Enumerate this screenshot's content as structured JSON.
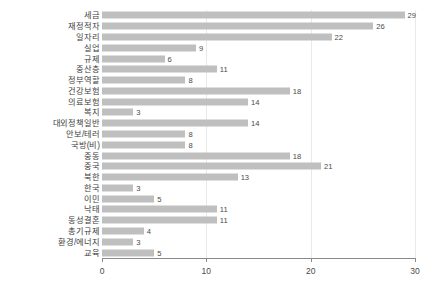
{
  "chart_data": {
    "type": "bar",
    "orientation": "horizontal",
    "title": "",
    "subtitle": "",
    "xlabel": "",
    "ylabel": "",
    "xlim": [
      0,
      30
    ],
    "xticks": [
      "0",
      "10",
      "20",
      "30"
    ],
    "xtick_values": [
      0,
      10,
      20,
      30
    ],
    "grid": true,
    "legend": null,
    "bar_color": "#bfbfbf",
    "axis_color": "#8a8a8a",
    "categories": [
      "세금",
      "재정적자",
      "일자리",
      "실업",
      "규제",
      "중산층",
      "정부역할",
      "건강보험",
      "의료보험",
      "복지",
      "대외정책일반",
      "안보/테러",
      "국방(비)",
      "중동",
      "중국",
      "북한",
      "한국",
      "이민",
      "낙태",
      "동성결혼",
      "총기규제",
      "환경/에너지",
      "교육"
    ],
    "values": [
      29,
      26,
      22,
      9,
      6,
      11,
      8,
      18,
      14,
      3,
      14,
      8,
      8,
      18,
      21,
      13,
      3,
      5,
      11,
      11,
      4,
      3,
      5
    ],
    "data_labels": [
      "29",
      "26",
      "22",
      "9",
      "6",
      "11",
      "8",
      "18",
      "14",
      "3",
      "14",
      "8",
      "8",
      "18",
      "21",
      "13",
      "3",
      "5",
      "11",
      "11",
      "4",
      "3",
      "5"
    ]
  }
}
